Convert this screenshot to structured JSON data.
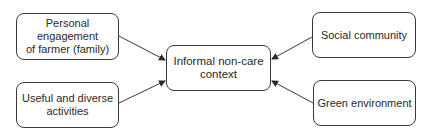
{
  "diagram": {
    "nodes": [
      {
        "id": "personal",
        "label": "Personal\nengagement\nof farmer (family)"
      },
      {
        "id": "useful",
        "label": "Useful and diverse\nactivities"
      },
      {
        "id": "center",
        "label": "Informal non-care\ncontext"
      },
      {
        "id": "social",
        "label": "Social community"
      },
      {
        "id": "green",
        "label": "Green environment"
      }
    ],
    "edges": [
      {
        "from": "personal",
        "to": "center"
      },
      {
        "from": "useful",
        "to": "center"
      },
      {
        "from": "social",
        "to": "center"
      },
      {
        "from": "green",
        "to": "center"
      }
    ],
    "colors": {
      "stroke": "#3a3a3a",
      "text": "#2a2a2a",
      "background": "#ffffff"
    }
  }
}
